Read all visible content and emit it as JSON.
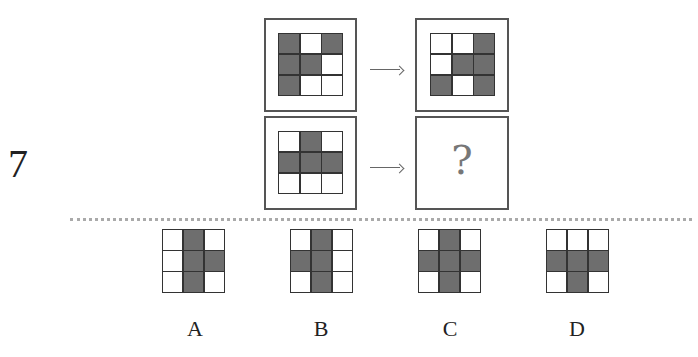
{
  "question": {
    "number": "7",
    "missing_marker": "?"
  },
  "colors": {
    "dark_cell": "#6e6e6e",
    "light_cell": "#ffffff",
    "grid_line": "#333333",
    "frame": "#555555"
  },
  "stimuli": [
    {
      "name": "pair-1-source",
      "grid": [
        [
          1,
          0,
          1
        ],
        [
          1,
          1,
          0
        ],
        [
          1,
          0,
          0
        ]
      ]
    },
    {
      "name": "pair-1-result",
      "grid": [
        [
          0,
          0,
          1
        ],
        [
          0,
          1,
          1
        ],
        [
          1,
          0,
          1
        ]
      ]
    },
    {
      "name": "pair-2-source",
      "grid": [
        [
          0,
          1,
          0
        ],
        [
          1,
          1,
          1
        ],
        [
          0,
          0,
          0
        ]
      ]
    }
  ],
  "options": [
    {
      "label": "A",
      "grid": [
        [
          0,
          1,
          0
        ],
        [
          0,
          1,
          1
        ],
        [
          0,
          1,
          0
        ]
      ]
    },
    {
      "label": "B",
      "grid": [
        [
          0,
          1,
          0
        ],
        [
          1,
          1,
          0
        ],
        [
          0,
          1,
          0
        ]
      ]
    },
    {
      "label": "C",
      "grid": [
        [
          0,
          1,
          0
        ],
        [
          1,
          1,
          1
        ],
        [
          0,
          1,
          0
        ]
      ]
    },
    {
      "label": "D",
      "grid": [
        [
          0,
          0,
          0
        ],
        [
          1,
          1,
          1
        ],
        [
          0,
          1,
          0
        ]
      ]
    }
  ]
}
